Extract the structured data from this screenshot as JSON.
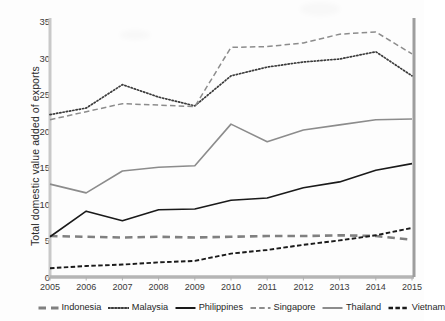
{
  "chart_data": {
    "type": "line",
    "title": "",
    "xlabel": "",
    "ylabel": "Total domestic value added of exports",
    "categories": [
      "2005",
      "2006",
      "2007",
      "2008",
      "2009",
      "2010",
      "2011",
      "2012",
      "2013",
      "2014",
      "2015"
    ],
    "ylim": [
      0,
      35
    ],
    "ytick_values": [
      0,
      5,
      10,
      15,
      20,
      25,
      30,
      35
    ],
    "grid": false,
    "legend_position": "bottom",
    "series": [
      {
        "name": "Indonesia",
        "style": "long-dashed",
        "color": "#808080",
        "values": [
          5.6,
          5.5,
          5.4,
          5.5,
          5.4,
          5.5,
          5.6,
          5.6,
          5.7,
          5.6,
          5.1
        ]
      },
      {
        "name": "Malaysia",
        "style": "dotted",
        "color": "#3a3a3a",
        "values": [
          22.2,
          23.1,
          26.3,
          24.6,
          23.4,
          27.5,
          28.7,
          29.4,
          29.8,
          30.8,
          27.5
        ]
      },
      {
        "name": "Philippines",
        "style": "solid",
        "color": "#1a1a1a",
        "values": [
          5.5,
          9.0,
          7.7,
          9.2,
          9.3,
          10.5,
          10.8,
          12.2,
          13.0,
          14.6,
          15.5
        ]
      },
      {
        "name": "Singapore",
        "style": "dashed",
        "color": "#8c8c8c",
        "values": [
          21.5,
          22.6,
          23.7,
          23.5,
          23.3,
          31.4,
          31.5,
          32.0,
          33.2,
          33.5,
          30.5
        ]
      },
      {
        "name": "Thailand",
        "style": "solid",
        "color": "#8c8c8c",
        "values": [
          12.7,
          11.5,
          14.5,
          15.0,
          15.2,
          20.9,
          18.5,
          20.1,
          20.8,
          21.5,
          21.6
        ]
      },
      {
        "name": "Vietnam",
        "style": "dash-dot",
        "color": "#1a1a1a",
        "values": [
          1.2,
          1.5,
          1.7,
          2.0,
          2.2,
          3.2,
          3.7,
          4.4,
          5.0,
          5.7,
          6.7
        ]
      }
    ]
  },
  "axis": {
    "y_label": "Total domestic value added of exports",
    "y_ticks": [
      "0",
      "5",
      "10",
      "15",
      "20",
      "25",
      "30",
      "35"
    ],
    "x_ticks": [
      "2005",
      "2006",
      "2007",
      "2008",
      "2009",
      "2010",
      "2011",
      "2012",
      "2013",
      "2014",
      "2015"
    ]
  },
  "legend": {
    "items": [
      {
        "label": "Indonesia",
        "color": "#808080",
        "style": "long-dashed"
      },
      {
        "label": "Malaysia",
        "color": "#3a3a3a",
        "style": "dotted"
      },
      {
        "label": "Philippines",
        "color": "#1a1a1a",
        "style": "solid"
      },
      {
        "label": "Singapore",
        "color": "#8c8c8c",
        "style": "dashed"
      },
      {
        "label": "Thailand",
        "color": "#8c8c8c",
        "style": "solid"
      },
      {
        "label": "Vietnam",
        "color": "#1a1a1a",
        "style": "dash-dot"
      }
    ]
  }
}
